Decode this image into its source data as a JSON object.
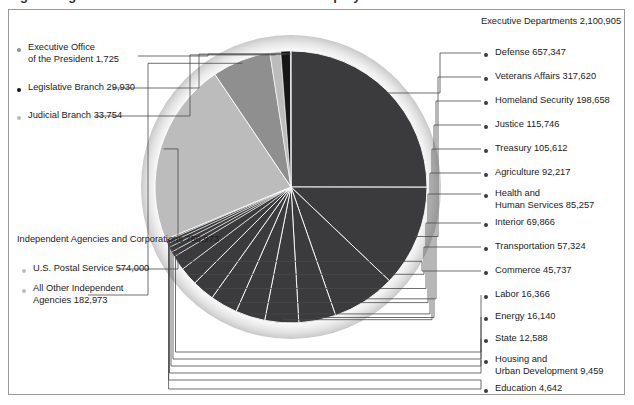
{
  "figure": {
    "title_partial": "Figure  Organization of the Federal Government Employment",
    "frame": true
  },
  "colors": {
    "dark": "#3b3b3d",
    "mid": "#8f8f8f",
    "light": "#bcbcbc",
    "black": "#161616",
    "leader": "#4a4a4a",
    "border": "#9a9a9a"
  },
  "groups": {
    "executive_departments": {
      "name": "Executive Departments",
      "total": "2,100,905"
    },
    "independent_agencies": {
      "line1": "Independent Agencies",
      "line2": "and Corporations  756,973"
    }
  },
  "left_labels": [
    {
      "name": "Executive Office",
      "name2": "of the President  1,725",
      "value": 1725,
      "bullet": "mid"
    },
    {
      "name": "Legislative Branch  29,930",
      "value": 29930,
      "bullet": "black"
    },
    {
      "name": "Judicial Branch  33,754",
      "value": 33754,
      "bullet": "light"
    }
  ],
  "independent_items": [
    {
      "name": "U.S. Postal Service  574,000",
      "value": 574000,
      "bullet": "light"
    },
    {
      "name": "All Other Independent",
      "name2": "Agencies  182,973",
      "value": 182973,
      "bullet": "light"
    }
  ],
  "right_labels": [
    {
      "name": "Defense  657,347",
      "value": 657347
    },
    {
      "name": "Veterans Affairs  317,620",
      "value": 317620
    },
    {
      "name": "Homeland Security  198,658",
      "value": 198658
    },
    {
      "name": "Justice  115,746",
      "value": 115746
    },
    {
      "name": "Treasury  105,612",
      "value": 105612
    },
    {
      "name": "Agriculture  92,217",
      "value": 92217
    },
    {
      "name": "Health and",
      "name2": "Human Services  85,257",
      "value": 85257
    },
    {
      "name": "Interior  69,866",
      "value": 69866
    },
    {
      "name": "Transportation  57,324",
      "value": 57324
    },
    {
      "name": "Commerce  45,737",
      "value": 45737
    },
    {
      "name": "Labor  16,366",
      "value": 16366
    },
    {
      "name": "Energy  16,140",
      "value": 16140
    },
    {
      "name": "State  12,588",
      "value": 12588
    },
    {
      "name": "Housing and",
      "name2": "Urban Development  9,459",
      "value": 9459
    },
    {
      "name": "Education  4,642",
      "value": 4642
    }
  ],
  "chart_data": {
    "type": "pie",
    "title": "Organization of the Federal Government Employment",
    "unit": "employees",
    "total": 2922287,
    "legend_position": "around-chart-with-leader-lines",
    "labels": [
      "Defense",
      "Veterans Affairs",
      "Homeland Security",
      "Justice",
      "Treasury",
      "Agriculture",
      "Health and Human Services",
      "Interior",
      "Transportation",
      "Commerce",
      "Labor",
      "Energy",
      "State",
      "Housing and Urban Development",
      "Education",
      "U.S. Postal Service",
      "All Other Independent Agencies",
      "Judicial Branch",
      "Legislative Branch",
      "Executive Office of the President"
    ],
    "values": [
      657347,
      317620,
      198658,
      115746,
      105612,
      92217,
      85257,
      69866,
      57324,
      45737,
      16366,
      16140,
      12588,
      9459,
      4642,
      574000,
      182973,
      33754,
      29930,
      1725
    ],
    "slice_colors": [
      "#3b3b3d",
      "#3b3b3d",
      "#3b3b3d",
      "#3b3b3d",
      "#3b3b3d",
      "#3b3b3d",
      "#3b3b3d",
      "#3b3b3d",
      "#3b3b3d",
      "#3b3b3d",
      "#3b3b3d",
      "#3b3b3d",
      "#3b3b3d",
      "#3b3b3d",
      "#3b3b3d",
      "#bcbcbc",
      "#8f8f8f",
      "#bcbcbc",
      "#161616",
      "#8f8f8f"
    ],
    "group_totals": {
      "Executive Departments": 2100905,
      "Independent Agencies and Corporations": 756973,
      "Judicial Branch": 33754,
      "Legislative Branch": 29930,
      "Executive Office of the President": 1725
    }
  }
}
